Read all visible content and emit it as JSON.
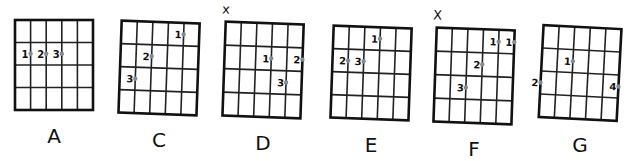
{
  "colors": {
    "line": "#111111",
    "dot": "#8a8a8a",
    "background": "#ffffff"
  },
  "chords": [
    {
      "name": "A",
      "muted": "",
      "x": 15,
      "y": 20,
      "w": 78,
      "h": 90,
      "skew": 0,
      "fingers": [
        {
          "label": "1",
          "string": 2,
          "fret": 2
        },
        {
          "label": "2",
          "string": 3,
          "fret": 2
        },
        {
          "label": "3",
          "string": 4,
          "fret": 2
        }
      ]
    },
    {
      "name": "C",
      "muted": "",
      "x": 120,
      "y": 22,
      "w": 78,
      "h": 92,
      "skew": -2,
      "fingers": [
        {
          "label": "1",
          "string": 5,
          "fret": 1
        },
        {
          "label": "2",
          "string": 3,
          "fret": 2
        },
        {
          "label": "3",
          "string": 2,
          "fret": 3
        }
      ]
    },
    {
      "name": "D",
      "muted": "x",
      "x": 224,
      "y": 23,
      "w": 78,
      "h": 94,
      "skew": -2,
      "fingers": [
        {
          "label": "1",
          "string": 4,
          "fret": 2
        },
        {
          "label": "2",
          "string": 6,
          "fret": 2
        },
        {
          "label": "3",
          "string": 5,
          "fret": 3
        }
      ]
    },
    {
      "name": "E",
      "muted": "",
      "x": 332,
      "y": 27,
      "w": 78,
      "h": 92,
      "skew": -2,
      "fingers": [
        {
          "label": "1",
          "string": 4,
          "fret": 1
        },
        {
          "label": "2",
          "string": 2,
          "fret": 2
        },
        {
          "label": "3",
          "string": 3,
          "fret": 2
        }
      ]
    },
    {
      "name": "F",
      "muted": "X",
      "x": 435,
      "y": 29,
      "w": 78,
      "h": 94,
      "skew": -2,
      "fingers": [
        {
          "label": "1",
          "string": 5,
          "fret": 1
        },
        {
          "label": "1",
          "string": 6,
          "fret": 1
        },
        {
          "label": "2",
          "string": 4,
          "fret": 2
        },
        {
          "label": "3",
          "string": 3,
          "fret": 3
        }
      ]
    },
    {
      "name": "G",
      "muted": "",
      "x": 541,
      "y": 27,
      "w": 78,
      "h": 92,
      "skew": -3,
      "fingers": [
        {
          "label": "1",
          "string": 3,
          "fret": 2
        },
        {
          "label": "2",
          "string": 1,
          "fret": 3
        },
        {
          "label": "4",
          "string": 6,
          "fret": 3
        }
      ]
    }
  ]
}
